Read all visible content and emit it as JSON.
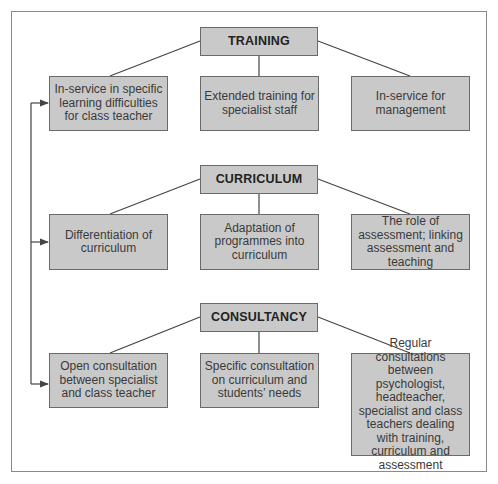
{
  "diagram": {
    "sections": [
      {
        "header": "TRAINING",
        "items": [
          "In-service in specific learning difficulties for class teacher",
          "Extended training for specialist staff",
          "In-service for management"
        ]
      },
      {
        "header": "CURRICULUM",
        "items": [
          "Differentiation of curriculum",
          "Adaptation of programmes into curriculum",
          "The role of assessment; linking assessment and teaching"
        ]
      },
      {
        "header": "CONSULTANCY",
        "items": [
          "Open consultation between specialist and class teacher",
          "Specific consultation on curriculum and students’ needs",
          "Regular consultations between psychologist, headteacher, specialist and class teachers dealing with training, curriculum and assessment"
        ]
      }
    ],
    "colors": {
      "box_fill": "#c9c9c9",
      "box_border": "#6a6a6a",
      "line": "#444444",
      "frame": "#8a8a8a"
    }
  }
}
